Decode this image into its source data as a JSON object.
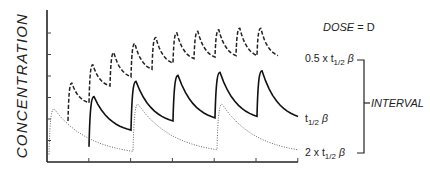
{
  "chart_data": {
    "type": "line",
    "title": "",
    "xlabel": "",
    "ylabel": "CONCENTRATION",
    "annotations": {
      "dose": "DOSE = D",
      "interval_bracket": "INTERVAL"
    },
    "x_ticks_count": 6,
    "y_ticks_count": 6,
    "grid": false,
    "legend_position": "right (inline labels)",
    "series": [
      {
        "name": "0.5 x t1/2 beta",
        "label_prefix": "0.5 x t",
        "label_sub": "1/2",
        "label_suffix": " β",
        "style": "dashed",
        "dose_interval_units": 0.5,
        "peaks": [
          0.52,
          0.64,
          0.72,
          0.78,
          0.82,
          0.85,
          0.86,
          0.87,
          0.88,
          0.88
        ],
        "troughs": [
          0.39,
          0.5,
          0.56,
          0.61,
          0.65,
          0.68,
          0.69,
          0.7,
          0.7,
          0.7
        ]
      },
      {
        "name": "t1/2 beta",
        "label_prefix": "t",
        "label_sub": "1/2",
        "label_suffix": " β",
        "style": "solid",
        "dose_interval_units": 1,
        "peaks": [
          0.43,
          0.53,
          0.57,
          0.59,
          0.6
        ],
        "troughs": [
          0.21,
          0.27,
          0.29,
          0.3,
          0.3
        ]
      },
      {
        "name": "2 x t1/2 beta",
        "label_prefix": "2 x t",
        "label_sub": "1/2",
        "label_suffix": " β",
        "style": "dotted",
        "dose_interval_units": 2,
        "peaks": [
          0.35,
          0.38,
          0.38
        ],
        "troughs": [
          0.07,
          0.08,
          0.08
        ]
      }
    ]
  },
  "labels": {
    "ylabel": "CONCENTRATION",
    "dose_prefix": "DOSE",
    "dose_eq": "=",
    "dose_value": "D",
    "interval": "INTERVAL",
    "s1_prefix": "0.5 x t",
    "s1_sub": "1/2",
    "s1_suffix": "β",
    "s2_prefix": "t",
    "s2_sub": "1/2",
    "s2_suffix": "β",
    "s3_prefix": "2 x t",
    "s3_sub": "1/2",
    "s3_suffix": "β"
  }
}
